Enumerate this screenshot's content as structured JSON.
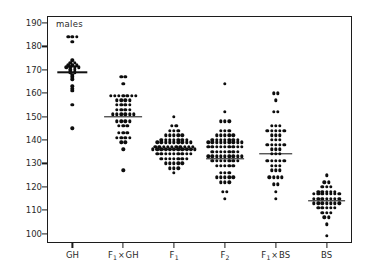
{
  "panel": {
    "label": "males"
  },
  "axes": {
    "y_ticks": [
      100,
      110,
      120,
      130,
      140,
      150,
      160,
      170,
      180,
      190
    ],
    "x_categories": [
      "GH",
      "F1×GH",
      "F1",
      "F2",
      "F1×BS",
      "BS"
    ]
  },
  "colors": {
    "ink": "#0d0d0d",
    "frame": "#1c1c1c",
    "background": "#ffffff"
  },
  "chart_data": {
    "type": "scatter",
    "title": "",
    "subtitle": "",
    "annotation": "males",
    "xlabel": "",
    "ylabel": "",
    "ylim": [
      96,
      193
    ],
    "yticks": [
      100,
      110,
      120,
      130,
      140,
      150,
      160,
      170,
      180,
      190
    ],
    "grid": false,
    "legend": "none",
    "plot_style": "dot-density strip plot with group mean lines",
    "categories": [
      "GH",
      "F1×GH",
      "F1",
      "F2",
      "F1×BS",
      "BS"
    ],
    "group_means": [
      169.0,
      150.0,
      136.0,
      132.0,
      134.0,
      114.0
    ],
    "groups": [
      {
        "name": "GH",
        "mean": 169.0,
        "n": 26,
        "values": [
          184,
          184,
          184,
          182,
          174,
          173,
          173,
          172,
          172,
          172,
          171,
          171,
          171,
          171,
          170,
          170,
          169,
          169,
          168,
          167,
          166,
          163,
          162,
          161,
          155,
          145
        ]
      },
      {
        "name": "F1×GH",
        "mean": 150.0,
        "n": 46,
        "values": [
          167,
          167,
          164,
          159,
          159,
          159,
          159,
          159,
          159,
          159,
          157,
          157,
          157,
          157,
          155,
          155,
          155,
          155,
          153,
          153,
          153,
          153,
          151,
          151,
          151,
          151,
          151,
          151,
          148,
          148,
          148,
          148,
          146,
          146,
          146,
          143,
          143,
          143,
          141,
          141,
          141,
          141,
          139,
          139,
          136,
          127
        ]
      },
      {
        "name": "F1",
        "mean": 136.0,
        "n": 72,
        "values": [
          150,
          146,
          146,
          144,
          144,
          144,
          142,
          142,
          142,
          142,
          142,
          140,
          140,
          140,
          140,
          140,
          140,
          140,
          139,
          139,
          139,
          139,
          139,
          139,
          139,
          139,
          139,
          137,
          137,
          137,
          137,
          137,
          137,
          137,
          137,
          137,
          137,
          136,
          136,
          136,
          136,
          136,
          136,
          136,
          136,
          136,
          136,
          136,
          134,
          134,
          134,
          134,
          134,
          134,
          134,
          134,
          134,
          132,
          132,
          132,
          132,
          132,
          132,
          132,
          130,
          130,
          130,
          130,
          130,
          128,
          128,
          128,
          126
        ]
      },
      {
        "name": "F2",
        "mean": 132.0,
        "n": 78,
        "values": [
          164,
          152,
          148,
          148,
          148,
          144,
          144,
          144,
          142,
          142,
          142,
          142,
          142,
          140,
          140,
          140,
          140,
          140,
          140,
          140,
          139,
          139,
          139,
          139,
          139,
          139,
          139,
          139,
          139,
          137,
          137,
          137,
          137,
          137,
          137,
          137,
          137,
          137,
          135,
          135,
          135,
          135,
          135,
          135,
          135,
          133,
          133,
          133,
          133,
          133,
          133,
          133,
          133,
          133,
          131,
          131,
          131,
          131,
          131,
          131,
          131,
          129,
          129,
          129,
          129,
          129,
          126,
          126,
          126,
          124,
          124,
          124,
          124,
          124,
          122,
          122,
          122,
          118,
          118,
          115
        ]
      },
      {
        "name": "F1×BS",
        "mean": 134.0,
        "n": 48,
        "values": [
          160,
          160,
          157,
          152,
          152,
          146,
          146,
          146,
          144,
          144,
          144,
          144,
          144,
          142,
          142,
          142,
          140,
          140,
          140,
          138,
          138,
          138,
          138,
          138,
          136,
          136,
          136,
          134,
          134,
          134,
          131,
          131,
          131,
          131,
          131,
          129,
          129,
          129,
          127,
          127,
          127,
          124,
          124,
          124,
          124,
          121,
          121,
          118,
          115
        ]
      },
      {
        "name": "BS",
        "mean": 114.0,
        "n": 44,
        "values": [
          125,
          122,
          122,
          120,
          120,
          120,
          118,
          118,
          118,
          118,
          118,
          117,
          117,
          117,
          117,
          117,
          117,
          117,
          115,
          115,
          115,
          115,
          115,
          115,
          115,
          113,
          113,
          113,
          113,
          113,
          113,
          113,
          111,
          111,
          111,
          111,
          111,
          109,
          109,
          109,
          107,
          107,
          104,
          99
        ]
      }
    ]
  }
}
